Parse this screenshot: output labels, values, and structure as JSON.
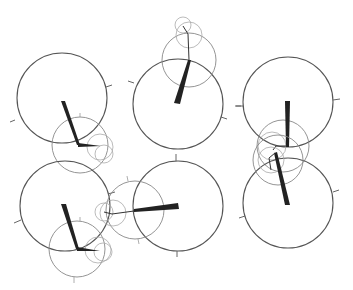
{
  "diagram": {
    "colors": {
      "background": "#ffffff",
      "major_circle": "#555555",
      "minor_circle": "#888888",
      "small_circle": "#aaaaaa",
      "hand": "#222222"
    },
    "clocks": [
      {
        "id": "top-left",
        "major": {
          "cx": 62,
          "cy": 98,
          "r": 45
        },
        "hand_tip": [
          62,
          102
        ],
        "hand_base": [
          78,
          145
        ],
        "sub_circles": [
          {
            "cx": 80,
            "cy": 145,
            "r": 28
          },
          {
            "cx": 100,
            "cy": 147,
            "r": 13
          },
          {
            "cx": 104,
            "cy": 154,
            "r": 9
          }
        ]
      },
      {
        "id": "top-middle",
        "major": {
          "cx": 178,
          "cy": 104,
          "r": 45
        },
        "hand_tip": [
          177,
          103
        ],
        "hand_base": [
          189,
          60
        ],
        "sub_circles": [
          {
            "cx": 189,
            "cy": 60,
            "r": 27
          },
          {
            "cx": 189,
            "cy": 35,
            "r": 13
          },
          {
            "cx": 183,
            "cy": 25,
            "r": 8
          }
        ]
      },
      {
        "id": "top-right",
        "major": {
          "cx": 288,
          "cy": 102,
          "r": 45
        },
        "hand_tip": [
          287,
          102
        ],
        "hand_base": [
          288,
          147
        ],
        "sub_circles": [
          {
            "cx": 283,
            "cy": 146,
            "r": 26
          },
          {
            "cx": 272,
            "cy": 146,
            "r": 14
          }
        ]
      },
      {
        "id": "middle-right",
        "major": {
          "cx": 288,
          "cy": 203,
          "r": 45
        },
        "hand_tip": [
          287,
          205
        ],
        "hand_base": [
          275,
          153
        ],
        "sub_circles": [
          {
            "cx": 278,
            "cy": 160,
            "r": 25
          },
          {
            "cx": 271,
            "cy": 160,
            "r": 13
          }
        ]
      },
      {
        "id": "bottom-left",
        "major": {
          "cx": 65,
          "cy": 206,
          "r": 45
        },
        "hand_tip": [
          63,
          206
        ],
        "hand_base": [
          77,
          249
        ],
        "sub_circles": [
          {
            "cx": 77,
            "cy": 249,
            "r": 28
          },
          {
            "cx": 98,
            "cy": 250,
            "r": 13
          },
          {
            "cx": 103,
            "cy": 252,
            "r": 9
          }
        ]
      },
      {
        "id": "bottom-middle",
        "major": {
          "cx": 178,
          "cy": 206,
          "r": 45
        },
        "hand_tip": [
          178,
          206
        ],
        "hand_base": [
          133,
          211
        ],
        "sub_circles": [
          {
            "cx": 135,
            "cy": 210,
            "r": 29
          },
          {
            "cx": 113,
            "cy": 213,
            "r": 13
          },
          {
            "cx": 104,
            "cy": 212,
            "r": 9
          }
        ]
      }
    ]
  }
}
